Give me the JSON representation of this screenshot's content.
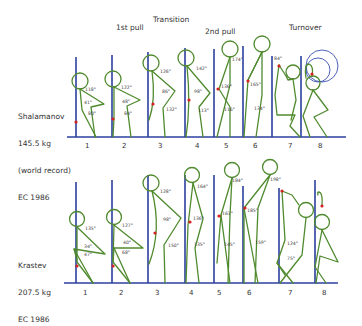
{
  "phases": {
    "first_pull": "1st pull",
    "transition": "Transition",
    "second_pull": "2nd pull",
    "turnover": "Turnover"
  },
  "athletes": [
    {
      "name": "Shalamanov",
      "weight": "145.5 kg",
      "note": "(world record)",
      "event": "EC 1986"
    },
    {
      "name": "Krastev",
      "weight": "207.5 kg",
      "event": "EC 1986"
    }
  ],
  "positions": [
    "1",
    "2",
    "3",
    "4",
    "5",
    "6",
    "7",
    "8"
  ],
  "angles": {
    "top": {
      "p1": [
        "118°",
        "41°",
        "80°"
      ],
      "p2": [
        "122°",
        "48°",
        "84°"
      ],
      "p3": [
        "126°",
        "86°",
        "132°"
      ],
      "p4": [
        "142°",
        "98°",
        "113°"
      ],
      "p5": [
        "174°",
        "136°",
        "116°"
      ],
      "p6": [
        "165°",
        "134°"
      ],
      "p7": [
        "84°"
      ]
    },
    "bottom": {
      "p1": [
        "135°",
        "34°",
        "47°"
      ],
      "p2": [
        "127°",
        "40°",
        "68°"
      ],
      "p3": [
        "128°",
        "98°",
        "150°"
      ],
      "p4": [
        "164°",
        "136°",
        "135°"
      ],
      "p5": [
        "184°",
        "161°",
        "145°"
      ],
      "p6": [
        "198°",
        "185°",
        "159°"
      ],
      "p7": [
        "124°",
        "75°"
      ]
    }
  },
  "colors": {
    "bar_path": "#2b3f9e",
    "figure": "#4f8a2e",
    "center_of_mass": "#d42020"
  }
}
